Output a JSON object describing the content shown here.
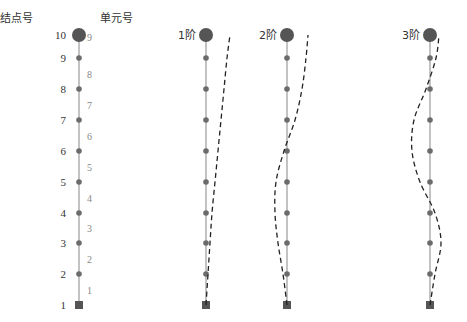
{
  "headers": {
    "node_label": "结点号",
    "element_label": "单元号"
  },
  "modes": [
    {
      "label": "1阶"
    },
    {
      "label": "2阶"
    },
    {
      "label": "3阶"
    }
  ],
  "nodes": [
    "1",
    "2",
    "3",
    "4",
    "5",
    "6",
    "7",
    "8",
    "9",
    "10"
  ],
  "elements": [
    "1",
    "2",
    "3",
    "4",
    "5",
    "6",
    "7",
    "8",
    "9"
  ],
  "colors": {
    "node": "#6b6b6b",
    "top_mass": "#555555",
    "axis_line": "#9a9a9a",
    "mode_curve": "#222222",
    "text": "#333333",
    "element_text": "#888888"
  },
  "chart_data": {
    "type": "diagram",
    "title": "",
    "node_y": [
      305,
      274,
      243,
      213,
      182,
      151,
      120,
      89,
      58,
      35
    ],
    "mode_shapes": [
      {
        "name": "1阶",
        "x_offsets": [
          0,
          2,
          4,
          6,
          9,
          12,
          15,
          18,
          21,
          24
        ]
      },
      {
        "name": "2阶",
        "x_offsets": [
          0,
          -4,
          -9,
          -12,
          -11,
          -3,
          8,
          15,
          19,
          21
        ]
      },
      {
        "name": "3阶",
        "x_offsets": [
          0,
          5,
          11,
          5,
          -10,
          -18,
          -16,
          -4,
          6,
          9
        ]
      }
    ]
  }
}
